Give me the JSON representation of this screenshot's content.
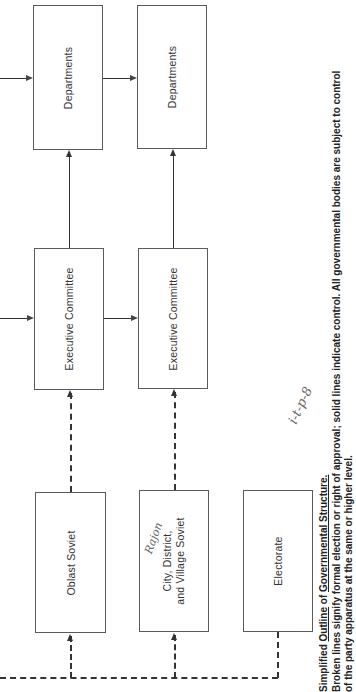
{
  "diagram": {
    "title": "Simplified Outline of Governmental Structure.",
    "title_parts": {
      "simplified": "Simplified",
      "outline": "Outline",
      "of": "of",
      "governmental_structure": "Governmental Structure."
    },
    "caption_line2": "Broken lines signify formal election or right of approval; solid lines indicate control. All governmental bodies are subject to control",
    "caption_line3": "of the party apparatus at the same or higher level.",
    "orientation": "rotated 90° counter-clockwise",
    "nodes": {
      "departments_upper": "Departments",
      "departments_lower": "Departments",
      "executive_committee_upper": "Executive Committee",
      "executive_committee_lower": "Executive Committee",
      "oblast_soviet": "Oblast Soviet",
      "city_soviet_line1": "City, District,",
      "city_soviet_line2": "and Village Soviet",
      "electorate": "Electorate"
    },
    "edges": [
      {
        "from": "Electorate",
        "to": "Oblast Soviet",
        "style": "dashed"
      },
      {
        "from": "Electorate",
        "to": "City, District, and Village Soviet",
        "style": "dashed"
      },
      {
        "from": "Oblast Soviet",
        "to": "Executive Committee (upper)",
        "style": "dashed"
      },
      {
        "from": "City, District, and Village Soviet",
        "to": "Executive Committee (lower)",
        "style": "dashed"
      },
      {
        "from": "Executive Committee (upper)",
        "to": "Departments (upper)",
        "style": "solid"
      },
      {
        "from": "Executive Committee (lower)",
        "to": "Departments (lower)",
        "style": "solid"
      },
      {
        "from": "Executive Committee (upper)",
        "to": "Executive Committee (lower)",
        "style": "solid"
      },
      {
        "from": "Departments (upper)",
        "to": "Departments (lower)",
        "style": "solid"
      },
      {
        "from": "higher level (off-page)",
        "to": "Executive Committee (upper)",
        "style": "solid"
      },
      {
        "from": "higher level (off-page)",
        "to": "Departments (upper)",
        "style": "solid"
      },
      {
        "from": "higher level (off-page)",
        "to": "Oblast Soviet / City Soviet bus",
        "style": "dashed"
      }
    ],
    "handwriting": {
      "note_on_city_box": "Rajon",
      "margin_note": "i-t-p-8"
    }
  }
}
